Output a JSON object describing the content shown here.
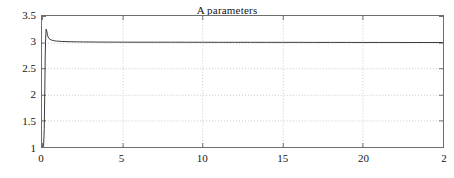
{
  "chart_data": {
    "type": "line",
    "title": "A parameters",
    "xlabel": "",
    "ylabel": "",
    "xlim": [
      0,
      25
    ],
    "ylim": [
      1,
      3.5
    ],
    "grid": true,
    "legend": null,
    "xticks": [
      0,
      5,
      10,
      15,
      20,
      25
    ],
    "xtick_labels": [
      "0",
      "5",
      "10",
      "15",
      "20",
      "2"
    ],
    "yticks": [
      1,
      1.5,
      2,
      2.5,
      3,
      3.5
    ],
    "ytick_labels": [
      "1",
      "1.5",
      "2",
      "2.5",
      "3",
      "3.5"
    ],
    "line_color": "#3a3a3a",
    "grid_color": "#c8c8c8",
    "axis_color": "#6e6e6e",
    "background": "#ffffff",
    "series": [
      {
        "name": "A parameter",
        "x": [
          0,
          0.05,
          0.1,
          0.14,
          0.18,
          0.2,
          0.22,
          0.24,
          0.26,
          0.3,
          0.34,
          0.38,
          0.44,
          0.5,
          0.6,
          0.7,
          0.8,
          0.9,
          1.0,
          1.2,
          1.5,
          1.8,
          2.2,
          2.6,
          3.0,
          3.5,
          4.0,
          5.0,
          6.0,
          7.0,
          8.0,
          9.0,
          10.0,
          11.0,
          12.0,
          13.0,
          14.0,
          15.0,
          16.0,
          17.0,
          18.0,
          19.0,
          20.0,
          21.0,
          22.0,
          23.0,
          24.0,
          25.0
        ],
        "y": [
          1.0,
          1.0,
          1.02,
          1.35,
          2.2,
          2.72,
          3.0,
          3.16,
          3.25,
          3.21,
          3.14,
          3.1,
          3.07,
          3.055,
          3.04,
          3.032,
          3.026,
          3.022,
          3.019,
          3.015,
          3.011,
          3.009,
          3.007,
          3.005,
          3.004,
          3.003,
          3.002,
          3.001,
          3.0,
          3.0,
          3.0,
          2.999,
          2.999,
          2.998,
          2.998,
          2.998,
          2.997,
          2.997,
          2.997,
          2.996,
          2.996,
          2.996,
          2.995,
          2.995,
          2.995,
          2.994,
          2.994,
          2.994
        ]
      }
    ]
  }
}
